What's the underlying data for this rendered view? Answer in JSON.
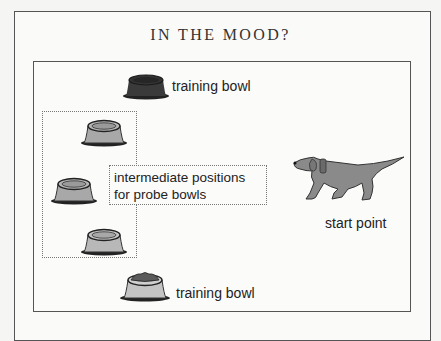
{
  "title": "IN THE MOOD?",
  "diagram": {
    "training_bowl_top": {
      "label": "training bowl",
      "color": "#3a3a3a"
    },
    "training_bowl_bottom": {
      "label": "training bowl",
      "color": "#c4c4c4"
    },
    "probe_bowls": [
      {
        "position": 1,
        "color": "#a8a8a8"
      },
      {
        "position": 2,
        "color": "#a8a8a8"
      },
      {
        "position": 3,
        "color": "#b8b8b8"
      }
    ],
    "probe_region_label_line1": "intermediate positions",
    "probe_region_label_line2": "for probe bowls",
    "dog": {
      "label": "start point",
      "color": "#888888"
    }
  }
}
